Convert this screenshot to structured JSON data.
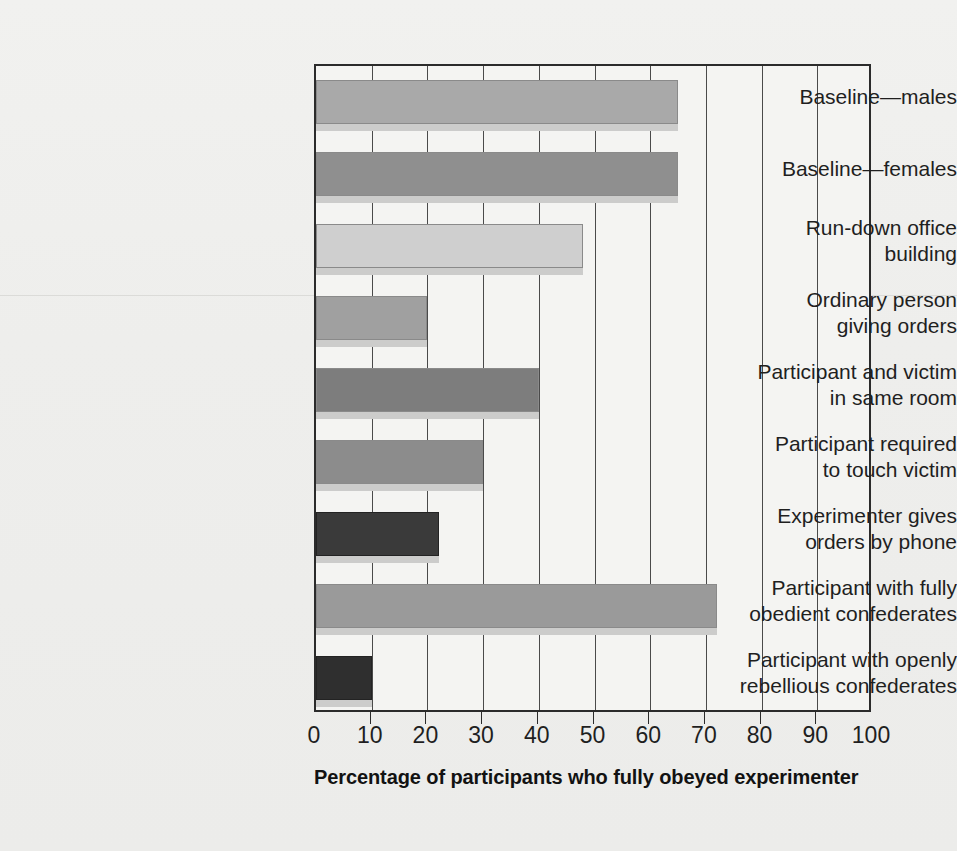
{
  "chart_data": {
    "type": "bar",
    "orientation": "horizontal",
    "title": "",
    "xlabel": "Percentage of participants who fully obeyed experimenter",
    "ylabel": "",
    "xlim": [
      0,
      100
    ],
    "xticks": [
      0,
      10,
      20,
      30,
      40,
      50,
      60,
      70,
      80,
      90,
      100
    ],
    "xtick_labels": [
      "0",
      "10",
      "20",
      "30",
      "40",
      "50",
      "60",
      "70",
      "80",
      "90",
      "100"
    ],
    "grid": "vertical",
    "legend": "none",
    "categories": [
      "Baseline—males",
      "Baseline—females",
      "Run-down office building",
      "Ordinary person giving orders",
      "Participant and victim in same room",
      "Participant required to touch victim",
      "Experimenter gives orders by phone",
      "Participant with fully obedient confederates",
      "Participant with openly rebellious confederates"
    ],
    "category_lines": [
      [
        "Baseline—males"
      ],
      [
        "Baseline—females"
      ],
      [
        "Run-down office",
        "building"
      ],
      [
        "Ordinary person",
        "giving orders"
      ],
      [
        "Participant and victim",
        "in same room"
      ],
      [
        "Participant required",
        "to touch victim"
      ],
      [
        "Experimenter gives",
        "orders by phone"
      ],
      [
        "Participant with fully",
        "obedient confederates"
      ],
      [
        "Participant with openly",
        "rebellious confederates"
      ]
    ],
    "values": [
      65,
      65,
      48,
      20,
      40,
      30,
      22,
      72,
      10
    ],
    "bar_colors": [
      "#a9a9a9",
      "#8f8f8f",
      "#cfcfcf",
      "#a0a0a0",
      "#7d7d7d",
      "#8c8c8c",
      "#3a3a3a",
      "#9a9a9a",
      "#2f2f2f"
    ],
    "shadow_color": "#cccccb"
  },
  "axis": {
    "title": "Percentage of participants who fully obeyed experimenter"
  }
}
